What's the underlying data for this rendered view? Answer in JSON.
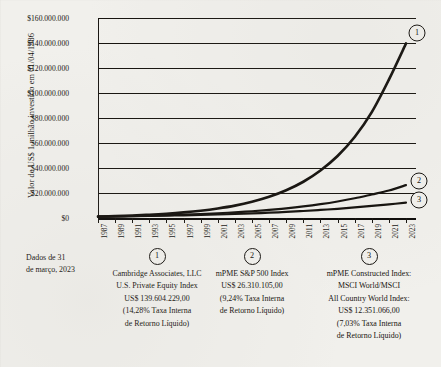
{
  "chart_data": {
    "type": "line",
    "title": "",
    "ylabel": "Valor de US$ 1 milhão investido em 01/04/1986",
    "xlabel": "",
    "ylim": [
      0,
      160000000
    ],
    "grid": true,
    "legend_position": "below",
    "y_ticks": [
      "$160.000.000",
      "$140.000.000",
      "$120.000.000",
      "$100.000.000",
      "$80.000.000",
      "$60.000.000",
      "$40.000.000",
      "$20.000.000",
      "$0"
    ],
    "y_tick_values": [
      160000000,
      140000000,
      120000000,
      100000000,
      80000000,
      60000000,
      40000000,
      20000000,
      0
    ],
    "categories": [
      "1987",
      "1989",
      "1991",
      "1993",
      "1995",
      "1997",
      "1999",
      "2001",
      "2003",
      "2005",
      "2007",
      "2009",
      "2011",
      "2013",
      "2015",
      "2017",
      "2019",
      "2021",
      "2023"
    ],
    "series": [
      {
        "name": "Cambridge Associates, LLC U.S. Private Equity Index",
        "marker": "1",
        "final_value": 139604229,
        "values": [
          1150000,
          1520000,
          1990000,
          2600000,
          3400000,
          4450000,
          5800000,
          7600000,
          9900000,
          13000000,
          17000000,
          22200000,
          29000000,
          38000000,
          49600000,
          64800000,
          84700000,
          110700000,
          139604229
        ]
      },
      {
        "name": "mPME S&P 500 Index",
        "marker": "2",
        "final_value": 26310105,
        "values": [
          1090000,
          1300000,
          1550000,
          1860000,
          2220000,
          2650000,
          3170000,
          3790000,
          4530000,
          5410000,
          6470000,
          7730000,
          9240000,
          11040000,
          13200000,
          15770000,
          18840000,
          22020000,
          26310105
        ]
      },
      {
        "name": "mPME Constructed Index: MSCI World/MSCI All Country World Index",
        "marker": "3",
        "final_value": 12351066,
        "values": [
          1070000,
          1230000,
          1410000,
          1620000,
          1860000,
          2130000,
          2450000,
          2810000,
          3220000,
          3700000,
          4250000,
          4870000,
          5590000,
          6420000,
          7360000,
          8450000,
          9690000,
          10900000,
          12351066
        ]
      }
    ]
  },
  "data_note": {
    "line1": "Dados de 31",
    "line2": "de março, 2023"
  },
  "legend": [
    {
      "marker": "1",
      "lines": [
        "Cambridge Associates, LLC",
        "U.S. Private Equity Index",
        "US$ 139.604.229,00",
        "(14,28% Taxa Interna",
        "de Retorno Líquido)"
      ]
    },
    {
      "marker": "2",
      "lines": [
        "mPME S&P 500 Index",
        "US$ 26.310.105,00",
        "(9,24% Taxa Interna",
        "de Retorno Líquido)"
      ]
    },
    {
      "marker": "3",
      "lines": [
        "mPME Constructed Index:",
        "MSCI World/MSCI",
        "All Country World Index:",
        "US$ 12.351.066,00",
        "(7,03% Taxa Interna",
        "de Retorno Líquido)"
      ]
    }
  ],
  "colors": {
    "background": "#f1f0ec",
    "ink": "#16130f",
    "line": "#14110d"
  }
}
